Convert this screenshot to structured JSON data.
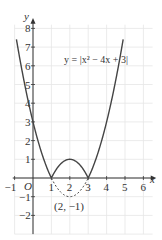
{
  "chart_data": {
    "type": "line",
    "title": "",
    "equation_label": "y = |x² − 4x + 3|",
    "xlabel": "x",
    "ylabel": "y",
    "origin_label": "O",
    "xlim": [
      -1,
      6.5
    ],
    "ylim": [
      -3,
      8.2
    ],
    "grid": true,
    "x_ticks": [
      -1,
      1,
      2,
      3,
      4,
      5,
      6
    ],
    "y_ticks": [
      -2,
      -1,
      1,
      2,
      3,
      4,
      5,
      6,
      7,
      8
    ],
    "x_tick_labels": [
      "−1",
      "1",
      "2",
      "3",
      "4",
      "5",
      "6"
    ],
    "y_tick_labels": [
      "−2",
      "−1",
      "1",
      "2",
      "3",
      "4",
      "5",
      "6",
      "7",
      "8"
    ],
    "series": [
      {
        "name": "y = |x² − 4x + 3|",
        "style": "solid",
        "x": [
          -0.9,
          -0.5,
          0,
          0.5,
          1,
          1.5,
          2,
          2.5,
          3,
          3.5,
          4,
          4.5,
          4.9
        ],
        "y": [
          7.41,
          5.25,
          3,
          1.25,
          0,
          0.75,
          1,
          0.75,
          0,
          1.25,
          3,
          5.25,
          7.41
        ]
      },
      {
        "name": "reflected part y = x² − 4x + 3",
        "style": "dashed",
        "x": [
          1,
          1.5,
          2,
          2.5,
          3
        ],
        "y": [
          0,
          -0.75,
          -1,
          -0.75,
          0
        ]
      }
    ],
    "annotations": [
      {
        "text": "(2, −1)",
        "x": 2,
        "y": -1,
        "note": "vertex of reflected parabola"
      }
    ]
  },
  "colors": {
    "curve": "#444444",
    "axis": "#333333",
    "grid": "#e6e6e6",
    "text": "#333333"
  }
}
